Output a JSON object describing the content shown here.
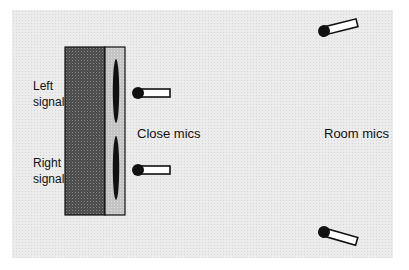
{
  "diagram": {
    "speaker": {
      "left_label_line1": "Left",
      "left_label_line2": "signal",
      "right_label_line1": "Right",
      "right_label_line2": "signal"
    },
    "close_mics_label": "Close mics",
    "room_mics_label": "Room mics",
    "colors": {
      "background": "#ececec",
      "speaker_dark": "#555555",
      "speaker_light": "#c8c8c8",
      "outline": "#111111",
      "driver": "#111111"
    }
  }
}
